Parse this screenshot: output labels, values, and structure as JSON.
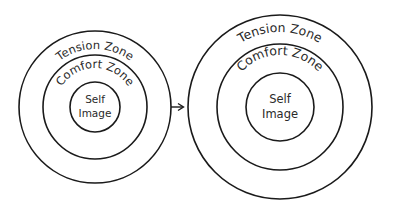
{
  "diagram": {
    "before": {
      "outer_label": "Tension Zone",
      "middle_label": "Comfort Zone",
      "inner_label_line1": "Self",
      "inner_label_line2": "Image"
    },
    "after": {
      "outer_label": "Tension Zone",
      "middle_label": "Comfort Zone",
      "inner_label_line1": "Self",
      "inner_label_line2": "Image"
    },
    "arrow": "right-arrow",
    "colors": {
      "stroke": "#1a1a1a",
      "background": "#ffffff"
    }
  }
}
